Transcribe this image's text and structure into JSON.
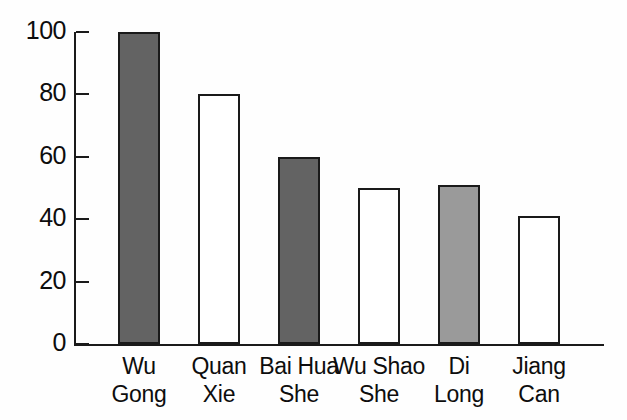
{
  "chart_data": {
    "type": "bar",
    "title": "",
    "subtitle": "",
    "xlabel": "",
    "ylabel": "",
    "categories": [
      "Wu Gong",
      "Quan Xie",
      "Bai Hua She",
      "Wu Shao She",
      "Di Long",
      "Jiang Can"
    ],
    "category_lines": [
      [
        "Wu",
        "Gong"
      ],
      [
        "Quan",
        "Xie"
      ],
      [
        "Bai Hua",
        "She"
      ],
      [
        "Wu Shao",
        "She"
      ],
      [
        "Di",
        "Long"
      ],
      [
        "Jiang",
        "Can"
      ]
    ],
    "values": [
      100,
      80,
      60,
      50,
      51,
      41
    ],
    "bar_styles": [
      "filled-dark",
      "hollow",
      "filled-dark",
      "hollow",
      "filled-light",
      "hollow"
    ],
    "ylim": [
      0,
      100
    ],
    "yticks": [
      0,
      20,
      40,
      60,
      80,
      100
    ],
    "ytick_labels": [
      "0",
      "20",
      "40",
      "60",
      "80",
      "100"
    ],
    "grid": false,
    "legend": "none",
    "colors": {
      "bar_fill_dark": "#636363",
      "bar_fill_light": "#9a9a9a",
      "bar_fill_hollow": "#ffffff",
      "bar_outline": "#1a1a1a",
      "axis": "#1a1a1a",
      "text": "#0d0d0d",
      "background": "#fefefe"
    }
  }
}
